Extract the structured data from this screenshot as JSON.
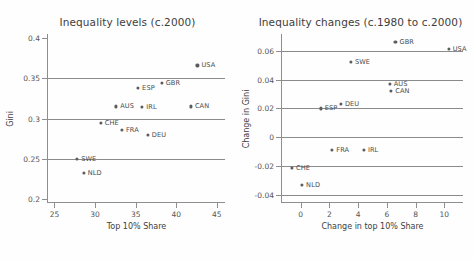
{
  "chart_data": [
    {
      "type": "scatter",
      "title": "Inequality levels (c.2000)",
      "xlabel": "Top 10% Share",
      "ylabel": "Gini",
      "xlim": [
        24.2,
        46.0
      ],
      "ylim": [
        0.195,
        0.405
      ],
      "xticks": [
        25,
        30,
        35,
        40,
        45
      ],
      "xticklabels": [
        "25",
        "30",
        "35",
        "40",
        "45"
      ],
      "yticks": [
        0.2,
        0.25,
        0.3,
        0.35,
        0.4
      ],
      "yticklabels": [
        "0.2",
        "0.25",
        "0.3",
        "0.35",
        "0.4"
      ],
      "gridlines_y": [
        0.25,
        0.3,
        0.35
      ],
      "grid": "horizontal",
      "legend": "none",
      "points": [
        {
          "label": "SWE",
          "x": 27.8,
          "y": 0.25
        },
        {
          "label": "NLD",
          "x": 28.6,
          "y": 0.232
        },
        {
          "label": "CHE",
          "x": 30.7,
          "y": 0.295
        },
        {
          "label": "AUS",
          "x": 32.6,
          "y": 0.315
        },
        {
          "label": "FRA",
          "x": 33.3,
          "y": 0.286
        },
        {
          "label": "ESP",
          "x": 35.3,
          "y": 0.338
        },
        {
          "label": "IRL",
          "x": 35.8,
          "y": 0.314
        },
        {
          "label": "DEU",
          "x": 36.5,
          "y": 0.28
        },
        {
          "label": "GBR",
          "x": 38.2,
          "y": 0.344
        },
        {
          "label": "CAN",
          "x": 41.8,
          "y": 0.315
        },
        {
          "label": "USA",
          "x": 42.6,
          "y": 0.366
        }
      ]
    },
    {
      "type": "scatter",
      "title": "Inequality changes (c.1980 to c.2000)",
      "xlabel": "Change in top 10% Share",
      "ylabel": "Change in Gini",
      "xlim": [
        -1.3,
        11.3
      ],
      "ylim": [
        -0.0455,
        0.0715
      ],
      "xticks": [
        0,
        2,
        4,
        6,
        8,
        10
      ],
      "xticklabels": [
        "0",
        "2",
        "4",
        "6",
        "8",
        "10"
      ],
      "yticks": [
        -0.04,
        -0.02,
        0,
        0.02,
        0.04,
        0.06
      ],
      "yticklabels": [
        "-0.04",
        "-0.02",
        "0",
        "0.02",
        "0.04",
        "0.06"
      ],
      "gridlines_y": [
        -0.04,
        -0.02,
        0,
        0.02,
        0.04,
        0.06
      ],
      "grid": "horizontal",
      "legend": "none",
      "points": [
        {
          "label": "CHE",
          "x": -0.6,
          "y": -0.021
        },
        {
          "label": "NLD",
          "x": 0.1,
          "y": -0.033
        },
        {
          "label": "ESP",
          "x": 1.4,
          "y": 0.02
        },
        {
          "label": "FRA",
          "x": 2.2,
          "y": -0.009
        },
        {
          "label": "DEU",
          "x": 2.8,
          "y": 0.023
        },
        {
          "label": "SWE",
          "x": 3.5,
          "y": 0.052
        },
        {
          "label": "IRL",
          "x": 4.4,
          "y": -0.009
        },
        {
          "label": "AUS",
          "x": 6.2,
          "y": 0.037
        },
        {
          "label": "CAN",
          "x": 6.3,
          "y": 0.032
        },
        {
          "label": "GBR",
          "x": 6.6,
          "y": 0.066
        },
        {
          "label": "USA",
          "x": 10.3,
          "y": 0.061
        }
      ]
    }
  ]
}
